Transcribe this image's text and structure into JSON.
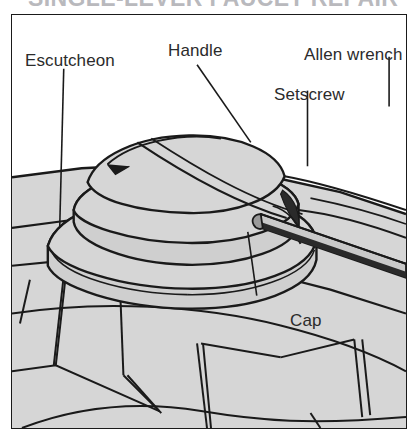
{
  "document": {
    "title_clipped": "SINGLE-LEVER FAUCET REPAIR",
    "figure_kind": "technical line illustration",
    "frame": {
      "border_color": "#1a1a1a",
      "background": "#ffffff"
    }
  },
  "colors": {
    "line": "#1a1a1a",
    "surface_light": "#d6d6d6",
    "surface_mid": "#cfcfcf",
    "surface_dark": "#2a2a2a",
    "paper": "#ffffff",
    "label_text": "#2b2b2b",
    "title_ghost": "#b9b9bd"
  },
  "callouts": [
    {
      "id": "escutcheon",
      "label": "Escutcheon",
      "leader": "vertical"
    },
    {
      "id": "handle",
      "label": "Handle",
      "leader": "diagonal-down-right"
    },
    {
      "id": "allen",
      "label": "Allen wrench",
      "leader": "vertical"
    },
    {
      "id": "setscrew",
      "label": "Setscrew",
      "leader": "vertical"
    },
    {
      "id": "cap",
      "label": "Cap",
      "leader": "diagonal-up-left"
    }
  ],
  "parts": [
    {
      "name": "handle",
      "description": "domed lever handle"
    },
    {
      "name": "cap",
      "description": "elliptical trim cap beneath handle"
    },
    {
      "name": "setscrew",
      "description": "recessed set screw at handle side"
    },
    {
      "name": "allen wrench",
      "description": "hex key inserted into setscrew"
    },
    {
      "name": "escutcheon",
      "description": "faceted base plate on counter"
    }
  ]
}
